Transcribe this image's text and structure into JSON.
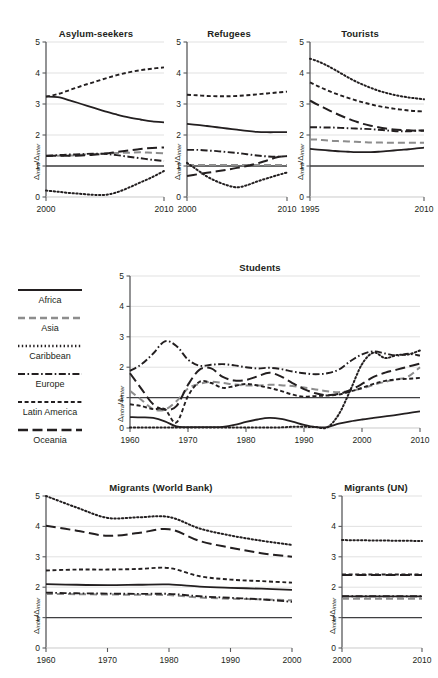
{
  "figure": {
    "ylabel": "Δintra/Δinter",
    "ylabel_num": "Δ",
    "ylabel_num_sub": "intra",
    "ylabel_den": "Δ",
    "ylabel_den_sub": "inter",
    "colors": {
      "line_dark": "#231f20",
      "line_gray": "#8d8d8d",
      "grid": "#d9d9d9",
      "axis": "#58595b",
      "background": "#ffffff"
    }
  },
  "legend": {
    "title": "",
    "items": [
      {
        "label": "Africa",
        "style": "solid",
        "color": "#231f20"
      },
      {
        "label": "Asia",
        "style": "dashed",
        "color": "#8d8d8d"
      },
      {
        "label": "Caribbean",
        "style": "dotted",
        "color": "#231f20"
      },
      {
        "label": "Europe",
        "style": "dashdot",
        "color": "#231f20"
      },
      {
        "label": "Latin America",
        "style": "shortdash",
        "color": "#231f20"
      },
      {
        "label": "Oceania",
        "style": "longdash",
        "color": "#231f20"
      }
    ]
  },
  "chart_data": [
    {
      "id": "asylum",
      "type": "line",
      "title": "Asylum-seekers",
      "xlabel": "",
      "ylabel": "Δintra/Δinter",
      "xlim": [
        2000,
        2010
      ],
      "ylim": [
        0,
        5
      ],
      "xticks": [
        2000,
        2010
      ],
      "xticklabels": [
        "2000",
        "2010"
      ],
      "yticks": [
        0,
        1,
        2,
        3,
        4,
        5
      ],
      "yticklabels": [
        "0",
        "1",
        "2",
        "3",
        "4",
        "5"
      ],
      "grid": "horizontal",
      "reference_line": 1,
      "legend_position": "external-left",
      "x": [
        2000,
        2001,
        2002,
        2003,
        2004,
        2005,
        2006,
        2007,
        2008,
        2009,
        2010
      ],
      "series": [
        {
          "name": "Africa",
          "style": "solid",
          "values": [
            3.24,
            3.22,
            3.12,
            3.0,
            2.88,
            2.76,
            2.66,
            2.57,
            2.5,
            2.44,
            2.41
          ]
        },
        {
          "name": "Asia",
          "style": "dashed",
          "values": [
            1.32,
            1.33,
            1.34,
            1.36,
            1.38,
            1.4,
            1.42,
            1.43,
            1.44,
            1.43,
            1.41
          ]
        },
        {
          "name": "Caribbean",
          "style": "dotted",
          "values": [
            0.21,
            0.17,
            0.13,
            0.1,
            0.07,
            0.07,
            0.15,
            0.3,
            0.47,
            0.64,
            0.84
          ]
        },
        {
          "name": "Europe",
          "style": "dashdot",
          "values": [
            1.33,
            1.35,
            1.37,
            1.38,
            1.4,
            1.39,
            1.35,
            1.3,
            1.25,
            1.2,
            1.16
          ]
        },
        {
          "name": "Latin America",
          "style": "shortdash",
          "values": [
            3.24,
            3.32,
            3.45,
            3.58,
            3.7,
            3.82,
            3.93,
            4.02,
            4.09,
            4.14,
            4.18
          ]
        },
        {
          "name": "Oceania",
          "style": "longdash",
          "values": [
            1.32,
            1.33,
            1.33,
            1.34,
            1.36,
            1.4,
            1.45,
            1.5,
            1.55,
            1.58,
            1.6
          ]
        }
      ]
    },
    {
      "id": "refugees",
      "type": "line",
      "title": "Refugees",
      "xlabel": "",
      "ylabel": "Δintra/Δinter",
      "xlim": [
        2000,
        2010
      ],
      "ylim": [
        0,
        5
      ],
      "xticks": [
        2000,
        2010
      ],
      "xticklabels": [
        "2000",
        "2010"
      ],
      "yticks": [
        0,
        1,
        2,
        3,
        4,
        5
      ],
      "yticklabels": [
        "0",
        "1",
        "2",
        "3",
        "4",
        "5"
      ],
      "grid": "horizontal",
      "reference_line": 1,
      "x": [
        2000,
        2001,
        2002,
        2003,
        2004,
        2005,
        2006,
        2007,
        2008,
        2009,
        2010
      ],
      "series": [
        {
          "name": "Africa",
          "style": "solid",
          "values": [
            2.36,
            2.33,
            2.29,
            2.25,
            2.21,
            2.17,
            2.13,
            2.1,
            2.09,
            2.09,
            2.09
          ]
        },
        {
          "name": "Asia",
          "style": "dashed",
          "values": [
            1.03,
            1.03,
            1.03,
            1.03,
            1.03,
            1.03,
            1.03,
            1.03,
            1.03,
            1.03,
            1.03
          ]
        },
        {
          "name": "Caribbean",
          "style": "dotted",
          "values": [
            1.1,
            0.88,
            0.66,
            0.5,
            0.38,
            0.31,
            0.38,
            0.5,
            0.6,
            0.7,
            0.79
          ]
        },
        {
          "name": "Europe",
          "style": "dashdot",
          "values": [
            1.52,
            1.52,
            1.5,
            1.48,
            1.45,
            1.42,
            1.38,
            1.34,
            1.31,
            1.3,
            1.32
          ]
        },
        {
          "name": "Latin America",
          "style": "shortdash",
          "values": [
            3.3,
            3.28,
            3.26,
            3.25,
            3.25,
            3.26,
            3.28,
            3.31,
            3.34,
            3.37,
            3.4
          ]
        },
        {
          "name": "Oceania",
          "style": "longdash",
          "values": [
            0.68,
            0.73,
            0.78,
            0.83,
            0.88,
            0.94,
            1.0,
            1.08,
            1.18,
            1.28,
            1.32
          ]
        }
      ]
    },
    {
      "id": "tourists",
      "type": "line",
      "title": "Tourists",
      "xlabel": "",
      "ylabel": "Δintra/Δinter",
      "xlim": [
        1995,
        2010
      ],
      "ylim": [
        0,
        5
      ],
      "xticks": [
        1995,
        2010
      ],
      "xticklabels": [
        "1995",
        "2010"
      ],
      "yticks": [
        0,
        1,
        2,
        3,
        4,
        5
      ],
      "yticklabels": [
        "0",
        "1",
        "2",
        "3",
        "4",
        "5"
      ],
      "grid": "horizontal",
      "reference_line": 1,
      "x": [
        1995,
        1996,
        1997,
        1998,
        1999,
        2000,
        2001,
        2002,
        2003,
        2004,
        2005,
        2006,
        2007,
        2008,
        2009,
        2010
      ],
      "series": [
        {
          "name": "Africa",
          "style": "solid",
          "values": [
            1.55,
            1.53,
            1.51,
            1.49,
            1.47,
            1.46,
            1.45,
            1.45,
            1.45,
            1.46,
            1.48,
            1.5,
            1.52,
            1.54,
            1.57,
            1.59
          ]
        },
        {
          "name": "Asia",
          "style": "dashed",
          "values": [
            1.86,
            1.85,
            1.83,
            1.81,
            1.8,
            1.79,
            1.78,
            1.77,
            1.76,
            1.76,
            1.75,
            1.75,
            1.75,
            1.75,
            1.75,
            1.75
          ]
        },
        {
          "name": "Caribbean",
          "style": "dotted",
          "values": [
            4.46,
            4.38,
            4.27,
            4.14,
            4.0,
            3.86,
            3.73,
            3.62,
            3.52,
            3.43,
            3.36,
            3.3,
            3.25,
            3.21,
            3.18,
            3.15
          ]
        },
        {
          "name": "Europe",
          "style": "dashdot",
          "values": [
            2.25,
            2.25,
            2.24,
            2.24,
            2.23,
            2.22,
            2.21,
            2.2,
            2.19,
            2.17,
            2.15,
            2.13,
            2.12,
            2.12,
            2.14,
            2.15
          ]
        },
        {
          "name": "Latin America",
          "style": "shortdash",
          "values": [
            3.7,
            3.58,
            3.47,
            3.37,
            3.28,
            3.2,
            3.12,
            3.05,
            2.99,
            2.93,
            2.89,
            2.85,
            2.82,
            2.79,
            2.77,
            2.76
          ]
        },
        {
          "name": "Oceania",
          "style": "longdash",
          "values": [
            3.11,
            2.98,
            2.86,
            2.74,
            2.63,
            2.53,
            2.44,
            2.36,
            2.3,
            2.25,
            2.21,
            2.18,
            2.16,
            2.15,
            2.14,
            2.14
          ]
        }
      ]
    },
    {
      "id": "students",
      "type": "line",
      "title": "Students",
      "xlabel": "",
      "ylabel": "Δintra/Δinter",
      "xlim": [
        1960,
        2010
      ],
      "ylim": [
        0,
        5
      ],
      "xticks": [
        1960,
        1970,
        1980,
        1990,
        2000,
        2010
      ],
      "xticklabels": [
        "1960",
        "1970",
        "1980",
        "1990",
        "2000",
        "2010"
      ],
      "yticks": [
        0,
        1,
        2,
        3,
        4,
        5
      ],
      "yticklabels": [
        "0",
        "1",
        "2",
        "3",
        "4",
        "5"
      ],
      "grid": "horizontal",
      "reference_line": 1,
      "x": [
        1960,
        1962,
        1964,
        1966,
        1968,
        1970,
        1972,
        1974,
        1976,
        1978,
        1980,
        1982,
        1984,
        1986,
        1988,
        1990,
        1992,
        1994,
        1996,
        1998,
        2000,
        2002,
        2004,
        2006,
        2008,
        2010
      ],
      "series": [
        {
          "name": "Africa",
          "style": "solid",
          "values": [
            0.36,
            0.35,
            0.33,
            0.22,
            0.05,
            0.03,
            0.03,
            0.03,
            0.04,
            0.1,
            0.2,
            0.28,
            0.33,
            0.3,
            0.21,
            0.1,
            0.03,
            0.03,
            0.14,
            0.22,
            0.28,
            0.33,
            0.38,
            0.43,
            0.49,
            0.55
          ]
        },
        {
          "name": "Asia",
          "style": "dashed",
          "values": [
            1.22,
            0.92,
            0.62,
            0.6,
            0.88,
            1.3,
            1.45,
            1.52,
            1.48,
            1.43,
            1.4,
            1.4,
            1.42,
            1.41,
            1.38,
            1.33,
            1.27,
            1.21,
            1.18,
            1.22,
            1.3,
            1.42,
            1.52,
            1.6,
            1.7,
            2.0
          ]
        },
        {
          "name": "Caribbean",
          "style": "dotted",
          "values": [
            0.02,
            0.02,
            0.02,
            0.02,
            0.02,
            0.02,
            0.02,
            0.02,
            0.02,
            0.02,
            0.02,
            0.02,
            0.02,
            0.02,
            0.04,
            0.04,
            0.03,
            0.02,
            0.45,
            1.25,
            2.1,
            2.48,
            2.3,
            2.4,
            2.42,
            2.55
          ]
        },
        {
          "name": "Europe",
          "style": "dashdot",
          "values": [
            1.88,
            2.1,
            2.45,
            2.85,
            2.7,
            2.25,
            2.05,
            2.08,
            2.1,
            2.06,
            2.0,
            1.96,
            1.98,
            1.94,
            1.86,
            1.8,
            1.77,
            1.8,
            1.92,
            2.2,
            2.42,
            2.52,
            2.45,
            2.38,
            2.44,
            2.38
          ]
        },
        {
          "name": "Latin America",
          "style": "shortdash",
          "values": [
            0.78,
            0.72,
            0.62,
            0.62,
            0.18,
            1.05,
            1.52,
            1.48,
            1.32,
            1.38,
            1.45,
            1.4,
            1.32,
            1.22,
            1.1,
            1.03,
            1.05,
            1.07,
            1.1,
            1.2,
            1.32,
            1.45,
            1.55,
            1.6,
            1.62,
            1.65
          ]
        },
        {
          "name": "Oceania",
          "style": "longdash",
          "values": [
            1.8,
            1.28,
            0.78,
            0.6,
            0.72,
            1.42,
            1.92,
            1.96,
            1.68,
            1.56,
            1.58,
            1.7,
            1.82,
            1.7,
            1.48,
            1.28,
            1.14,
            1.08,
            1.12,
            1.25,
            1.45,
            1.68,
            1.82,
            1.92,
            2.02,
            2.12
          ]
        }
      ]
    },
    {
      "id": "migrants_wb",
      "type": "line",
      "title": "Migrants (World Bank)",
      "xlabel": "",
      "ylabel": "Δintra/Δinter",
      "xlim": [
        1960,
        2000
      ],
      "ylim": [
        0,
        5
      ],
      "xticks": [
        1960,
        1970,
        1980,
        1990,
        2000
      ],
      "xticklabels": [
        "1960",
        "1970",
        "1980",
        "1990",
        "2000"
      ],
      "yticks": [
        0,
        1,
        2,
        3,
        4,
        5
      ],
      "yticklabels": [
        "0",
        "1",
        "2",
        "3",
        "4",
        "5"
      ],
      "grid": "horizontal",
      "reference_line": 1,
      "x": [
        1960,
        1965,
        1970,
        1975,
        1980,
        1985,
        1990,
        1995,
        2000
      ],
      "series": [
        {
          "name": "Africa",
          "style": "solid",
          "values": [
            2.1,
            2.08,
            2.07,
            2.08,
            2.09,
            2.02,
            1.98,
            1.95,
            1.91
          ]
        },
        {
          "name": "Asia",
          "style": "dashed",
          "values": [
            1.78,
            1.77,
            1.76,
            1.75,
            1.74,
            1.66,
            1.62,
            1.6,
            1.57
          ]
        },
        {
          "name": "Caribbean",
          "style": "dotted",
          "values": [
            5.0,
            4.62,
            4.28,
            4.3,
            4.31,
            3.93,
            3.7,
            3.53,
            3.39
          ]
        },
        {
          "name": "Europe",
          "style": "dashdot",
          "values": [
            1.82,
            1.8,
            1.79,
            1.78,
            1.78,
            1.7,
            1.65,
            1.6,
            1.52
          ]
        },
        {
          "name": "Latin America",
          "style": "shortdash",
          "values": [
            2.55,
            2.58,
            2.58,
            2.6,
            2.63,
            2.36,
            2.25,
            2.2,
            2.15
          ]
        },
        {
          "name": "Oceania",
          "style": "longdash",
          "values": [
            4.02,
            3.86,
            3.69,
            3.78,
            3.91,
            3.52,
            3.3,
            3.12,
            3.0
          ]
        }
      ]
    },
    {
      "id": "migrants_un",
      "type": "line",
      "title": "Migrants (UN)",
      "xlabel": "",
      "ylabel": "Δintra/Δinter",
      "xlim": [
        2000,
        2010
      ],
      "ylim": [
        0,
        5
      ],
      "xticks": [
        2000,
        2010
      ],
      "xticklabels": [
        "2000",
        "2010"
      ],
      "yticks": [
        0,
        1,
        2,
        3,
        4,
        5
      ],
      "yticklabels": [
        "0",
        "1",
        "2",
        "3",
        "4",
        "5"
      ],
      "grid": "horizontal",
      "reference_line": 1,
      "x": [
        2000,
        2010
      ],
      "series": [
        {
          "name": "Africa",
          "style": "solid",
          "values": [
            1.7,
            1.7
          ]
        },
        {
          "name": "Asia",
          "style": "dashed",
          "values": [
            1.62,
            1.62
          ]
        },
        {
          "name": "Caribbean",
          "style": "dotted",
          "values": [
            3.55,
            3.52
          ]
        },
        {
          "name": "Europe",
          "style": "dashdot",
          "values": [
            1.7,
            1.7
          ]
        },
        {
          "name": "Latin America",
          "style": "shortdash",
          "values": [
            2.42,
            2.42
          ]
        },
        {
          "name": "Oceania",
          "style": "longdash",
          "values": [
            2.4,
            2.4
          ]
        }
      ]
    }
  ]
}
